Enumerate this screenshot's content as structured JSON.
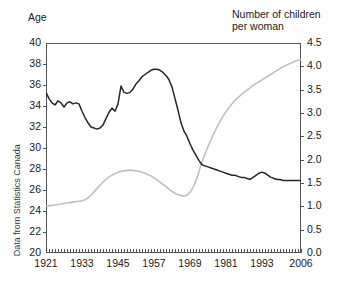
{
  "figure": {
    "left_axis_title": "Age",
    "right_axis_title": "Number of children\nper woman",
    "source_note": "Data from Statistics Canada"
  },
  "chart_data": {
    "type": "line",
    "title": "",
    "subtitle": "",
    "xlabel": "",
    "ylabel": "Age",
    "y2label": "Number of children per woman",
    "grid": false,
    "legend": "none",
    "xlim": [
      1921,
      2006
    ],
    "ylim": [
      20,
      40
    ],
    "y2lim": [
      0.0,
      4.5
    ],
    "x_ticks": [
      1921,
      1933,
      1945,
      1957,
      1969,
      1981,
      1993,
      2006
    ],
    "x_tick_labels": [
      "1921",
      "1933",
      "1945",
      "1957",
      "1969",
      "1981",
      "1993",
      "2006"
    ],
    "x_minor_tick_interval": 1,
    "y_ticks": [
      20,
      22,
      24,
      26,
      28,
      30,
      32,
      34,
      36,
      38,
      40
    ],
    "y_tick_labels": [
      "20",
      "22",
      "24",
      "26",
      "28",
      "30",
      "32",
      "34",
      "36",
      "38",
      "40"
    ],
    "y2_ticks": [
      0.0,
      0.5,
      1.0,
      1.5,
      2.0,
      2.5,
      3.0,
      3.5,
      4.0,
      4.5
    ],
    "y2_tick_labels": [
      "0.0",
      "0.5",
      "1.0",
      "1.5",
      "2.0",
      "2.5",
      "3.0",
      "3.5",
      "4.0",
      "4.5"
    ],
    "x": [
      1921,
      1922,
      1923,
      1924,
      1925,
      1926,
      1927,
      1928,
      1929,
      1930,
      1931,
      1932,
      1933,
      1934,
      1935,
      1936,
      1937,
      1938,
      1939,
      1940,
      1941,
      1942,
      1943,
      1944,
      1945,
      1946,
      1947,
      1948,
      1949,
      1950,
      1951,
      1952,
      1953,
      1954,
      1955,
      1956,
      1957,
      1958,
      1959,
      1960,
      1961,
      1962,
      1963,
      1964,
      1965,
      1966,
      1967,
      1968,
      1969,
      1970,
      1971,
      1972,
      1973,
      1974,
      1975,
      1976,
      1977,
      1978,
      1979,
      1980,
      1981,
      1982,
      1983,
      1984,
      1985,
      1986,
      1987,
      1988,
      1989,
      1990,
      1991,
      1992,
      1993,
      1994,
      1995,
      1996,
      1997,
      1998,
      1999,
      2000,
      2001,
      2002,
      2003,
      2004,
      2005,
      2006
    ],
    "series": [
      {
        "name": "Age",
        "axis": "left",
        "color": "#262626",
        "unit": "years",
        "values": [
          35.3,
          34.7,
          34.3,
          34.1,
          34.5,
          34.3,
          33.9,
          34.3,
          34.4,
          34.2,
          34.3,
          34.2,
          33.5,
          32.9,
          32.4,
          32.0,
          31.9,
          31.8,
          31.9,
          32.2,
          32.8,
          33.4,
          33.8,
          33.5,
          34.2,
          35.9,
          35.3,
          35.2,
          35.3,
          35.6,
          36.1,
          36.4,
          36.8,
          37.0,
          37.2,
          37.4,
          37.5,
          37.5,
          37.4,
          37.2,
          36.9,
          36.5,
          35.8,
          34.7,
          33.6,
          32.4,
          31.6,
          31.1,
          30.4,
          29.8,
          29.3,
          28.8,
          28.4,
          28.3,
          28.2,
          28.1,
          28.0,
          27.9,
          27.8,
          27.7,
          27.6,
          27.5,
          27.4,
          27.4,
          27.3,
          27.2,
          27.2,
          27.1,
          27.0,
          27.2,
          27.4,
          27.6,
          27.7,
          27.6,
          27.4,
          27.2,
          27.1,
          27.0,
          27.0,
          26.9,
          26.9,
          26.9,
          26.9,
          26.9,
          26.9,
          26.9
        ]
      },
      {
        "name": "Number of children per woman",
        "axis": "right",
        "color": "#c0c0c0",
        "unit": "children",
        "values": [
          1.0,
          1.01,
          1.02,
          1.03,
          1.04,
          1.05,
          1.06,
          1.07,
          1.08,
          1.09,
          1.1,
          1.11,
          1.12,
          1.14,
          1.18,
          1.24,
          1.31,
          1.38,
          1.45,
          1.52,
          1.58,
          1.63,
          1.67,
          1.7,
          1.73,
          1.75,
          1.76,
          1.77,
          1.77,
          1.77,
          1.76,
          1.75,
          1.73,
          1.71,
          1.68,
          1.65,
          1.61,
          1.57,
          1.52,
          1.47,
          1.42,
          1.37,
          1.32,
          1.28,
          1.25,
          1.23,
          1.22,
          1.24,
          1.3,
          1.4,
          1.55,
          1.75,
          1.95,
          2.12,
          2.28,
          2.43,
          2.57,
          2.7,
          2.82,
          2.93,
          3.03,
          3.12,
          3.2,
          3.27,
          3.33,
          3.39,
          3.44,
          3.49,
          3.54,
          3.59,
          3.63,
          3.67,
          3.71,
          3.75,
          3.79,
          3.83,
          3.87,
          3.91,
          3.95,
          3.99,
          4.02,
          4.05,
          4.08,
          4.11,
          4.13,
          4.15
        ]
      }
    ]
  }
}
